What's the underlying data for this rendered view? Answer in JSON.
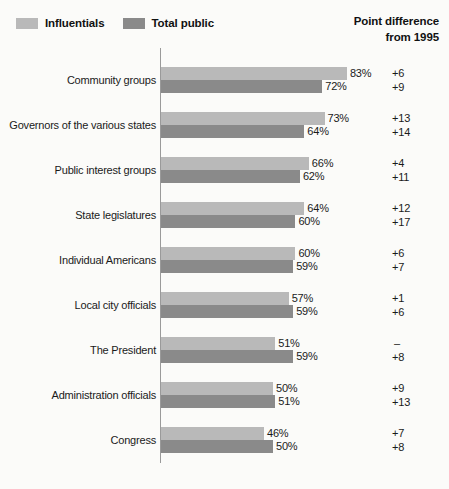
{
  "legend": {
    "items": [
      {
        "label": "Influentials",
        "color": "#b9b9b9",
        "icon": "legend-swatch-influentials"
      },
      {
        "label": "Total public",
        "color": "#8a8a8a",
        "icon": "legend-swatch-total-public"
      }
    ]
  },
  "diff_header": {
    "line1": "Point difference",
    "line2": "from 1995"
  },
  "chart_data": {
    "type": "bar",
    "orientation": "horizontal",
    "title": "",
    "subtitle": "",
    "xlabel": "",
    "ylabel": "",
    "xlim": [
      0,
      100
    ],
    "grid": false,
    "legend_position": "top-left",
    "categories": [
      "Community groups",
      "Governors of the various states",
      "Public interest groups",
      "State legislatures",
      "Individual Americans",
      "Local city officials",
      "The President",
      "Administration officials",
      "Congress"
    ],
    "series": [
      {
        "name": "Influentials",
        "color": "#b9b9b9",
        "values": [
          83,
          73,
          66,
          64,
          60,
          57,
          51,
          50,
          46
        ],
        "value_labels": [
          "83%",
          "73%",
          "66%",
          "64%",
          "60%",
          "57%",
          "51%",
          "50%",
          "46%"
        ],
        "point_difference_from_1995": [
          "+6",
          "+13",
          "+4",
          "+12",
          "+6",
          "+1",
          "–",
          "+9",
          "+7"
        ]
      },
      {
        "name": "Total public",
        "color": "#8a8a8a",
        "values": [
          72,
          64,
          62,
          60,
          59,
          59,
          59,
          51,
          50
        ],
        "value_labels": [
          "72%",
          "64%",
          "62%",
          "60%",
          "59%",
          "59%",
          "59%",
          "51%",
          "50%"
        ],
        "point_difference_from_1995": [
          "+9",
          "+14",
          "+11",
          "+17",
          "+7",
          "+6",
          "+8",
          "+13",
          "+8"
        ]
      }
    ]
  }
}
